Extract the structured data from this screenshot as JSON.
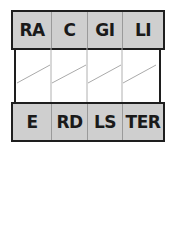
{
  "diagram": {
    "top_row": {
      "cells": [
        "RA",
        "C",
        "GI",
        "LI"
      ]
    },
    "bottom_row": {
      "cells": [
        "E",
        "RD",
        "LS",
        "TER"
      ]
    },
    "middle": {
      "columns": 4,
      "diagonal_lines": 4
    },
    "colors": {
      "cell_fill": "#cfcfcf",
      "border": "#1e1e1e",
      "divider": "#9a9a9a",
      "diagonal": "#aaaaaa"
    }
  }
}
